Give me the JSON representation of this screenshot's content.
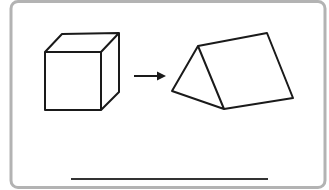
{
  "figure": {
    "description": "A cube transforms into a triangular prism",
    "shapes": [
      {
        "name": "cube",
        "type": "cube"
      },
      {
        "name": "arrow",
        "type": "right-arrow"
      },
      {
        "name": "triangular-prism",
        "type": "triangular-prism"
      }
    ],
    "answer_line": {
      "visible": true,
      "text": ""
    }
  },
  "colors": {
    "border": "#b3b3b3",
    "stroke": "#1a1a1a",
    "background": "#ffffff",
    "answer_line": "#333333"
  }
}
